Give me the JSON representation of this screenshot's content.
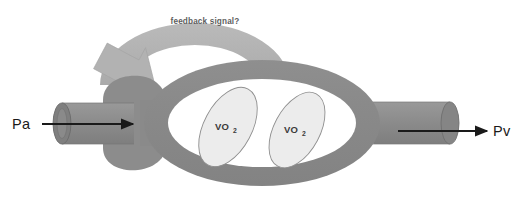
{
  "diagram": {
    "colors": {
      "vessel_gray": "#8c8c8c",
      "vessel_edge": "#6f6f6f",
      "feedback_gray": "#b2b2b2",
      "feedback_edge": "#9d9d9d",
      "chamber_fill": "#ffffff",
      "vo2_fill": "#ececec",
      "vo2_stroke": "#8f8f8f",
      "arrow_black": "#1a1a1a",
      "text_dark": "#1a1a1a",
      "text_muted": "#5e5e5e",
      "background": "#ffffff"
    },
    "inlet": {
      "label": "Pa",
      "arrow_name": "inlet-flow-arrow",
      "direction": "right"
    },
    "outlet": {
      "label": "Pv",
      "arrow_name": "outlet-flow-arrow",
      "direction": "right"
    },
    "feedback": {
      "label": "feedback signal?",
      "direction": "right-to-left",
      "arrowhead": "down-left"
    },
    "chamber": {
      "name": "capillary-chamber",
      "contents": [
        {
          "label": "VO",
          "subscript": "2"
        },
        {
          "label": "VO",
          "subscript": "2"
        }
      ]
    }
  }
}
